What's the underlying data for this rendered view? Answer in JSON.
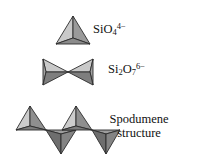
{
  "figure": {
    "name": "silicate-tetrahedra-diagram",
    "background_color": "#ffffff",
    "rows": [
      {
        "id": "monomer",
        "shape_name": "single-tetrahedron",
        "label_plain": "SiO4 4-",
        "label_parts": {
          "lead": "SiO",
          "sub": "4",
          "sup": "4−"
        }
      },
      {
        "id": "dimer",
        "shape_name": "double-tetrahedron-bowtie",
        "label_plain": "Si2O7 6-",
        "label_parts": {
          "lead": "Si",
          "sub1": "2",
          "mid": "O",
          "sub2": "7",
          "sup": "6−"
        }
      },
      {
        "id": "chain",
        "shape_name": "tetrahedra-chain",
        "label_line1": "Spodumene",
        "label_line2": "structure"
      }
    ],
    "colors": {
      "face_light": "#c6c6c6",
      "face_mid": "#a8a8a8",
      "face_dark": "#8d8d8d",
      "face_darkest": "#6f6f6f",
      "outline": "#2b2b2b",
      "text": "#111111"
    }
  }
}
